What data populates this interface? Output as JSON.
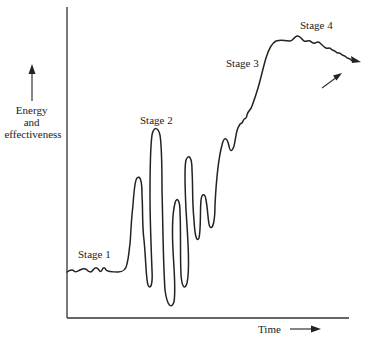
{
  "diagram": {
    "type": "line-sketch",
    "y_axis": {
      "label_lines": [
        "Energy",
        "and",
        "effectiveness"
      ],
      "arrow": "up"
    },
    "x_axis": {
      "label": "Time",
      "arrow": "right"
    },
    "stages": [
      {
        "label": "Stage 1",
        "description": "Low, gently wavy baseline"
      },
      {
        "label": "Stage 2",
        "description": "Large oscillating swings up and down"
      },
      {
        "label": "Stage 3",
        "description": "Steady rise with small wiggles"
      },
      {
        "label": "Stage 4",
        "description": "Plateau at peak, then slight decline with pointer arrow"
      }
    ],
    "colors": {
      "line": "#222222",
      "background": "#ffffff"
    }
  }
}
